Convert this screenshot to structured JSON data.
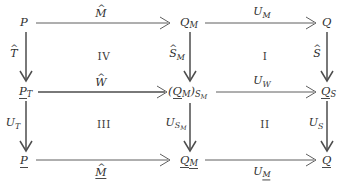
{
  "diagram": {
    "type": "commutative-diagram",
    "title": "",
    "grid": {
      "columns": 3,
      "rows": 3,
      "column_x": [
        24,
        188,
        326
      ],
      "row_y": [
        22,
        90,
        160
      ]
    },
    "nodes": [
      {
        "id": "n00",
        "row": 0,
        "col": 0,
        "text": "P",
        "base": "P",
        "hat": false,
        "underline": false,
        "sub": ""
      },
      {
        "id": "n01",
        "row": 0,
        "col": 1,
        "text": "Q_M",
        "base": "Q",
        "hat": false,
        "underline": false,
        "sub": "M"
      },
      {
        "id": "n02",
        "row": 0,
        "col": 2,
        "text": "Q",
        "base": "Q",
        "hat": false,
        "underline": false,
        "sub": ""
      },
      {
        "id": "n10",
        "row": 1,
        "col": 0,
        "text": "P_T",
        "base": "P",
        "hat": false,
        "underline": true,
        "sub": "T"
      },
      {
        "id": "n11",
        "row": 1,
        "col": 1,
        "text": "(Q_M)_S_M",
        "base": "(Q)",
        "hat": false,
        "underline": true,
        "sub": "S_M"
      },
      {
        "id": "n12",
        "row": 1,
        "col": 2,
        "text": "Q_S",
        "base": "Q",
        "hat": false,
        "underline": true,
        "sub": "S"
      },
      {
        "id": "n20",
        "row": 2,
        "col": 0,
        "text": "P",
        "base": "P",
        "hat": false,
        "underline": true,
        "sub": ""
      },
      {
        "id": "n21",
        "row": 2,
        "col": 1,
        "text": "Q_M",
        "base": "Q",
        "hat": false,
        "underline": true,
        "sub": "M"
      },
      {
        "id": "n22",
        "row": 2,
        "col": 2,
        "text": "Q",
        "base": "Q",
        "hat": false,
        "underline": true,
        "sub": ""
      }
    ],
    "edge_labels": {
      "top_left": {
        "base": "M",
        "hat": true,
        "underline": false,
        "sub": ""
      },
      "top_right": {
        "base": "U",
        "hat": false,
        "underline": false,
        "sub": "M"
      },
      "middle_left": {
        "base": "W",
        "hat": true,
        "underline": false,
        "sub": ""
      },
      "middle_right": {
        "base": "U",
        "hat": false,
        "underline": false,
        "sub": "W"
      },
      "bottom_left": {
        "base": "M",
        "hat": true,
        "underline": true,
        "sub": ""
      },
      "bottom_right": {
        "base": "U",
        "hat": false,
        "underline": false,
        "sub": "M-underlined"
      },
      "left_upper": {
        "base": "T",
        "hat": true,
        "underline": false,
        "sub": ""
      },
      "left_lower": {
        "base": "U",
        "hat": false,
        "underline": false,
        "sub": "T"
      },
      "center_upper": {
        "base": "S",
        "hat": true,
        "underline": false,
        "sub": "M"
      },
      "center_lower": {
        "base": "U",
        "hat": false,
        "underline": false,
        "sub": "S_M"
      },
      "right_upper": {
        "base": "S",
        "hat": true,
        "underline": false,
        "sub": ""
      },
      "right_lower": {
        "base": "U",
        "hat": false,
        "underline": false,
        "sub": "S"
      }
    },
    "region_labels": [
      {
        "id": "region-I",
        "text": "I",
        "row": 0,
        "col": 1
      },
      {
        "id": "region-II",
        "text": "II",
        "row": 1,
        "col": 1
      },
      {
        "id": "region-III",
        "text": "III",
        "row": 1,
        "col": 0
      },
      {
        "id": "region-IV",
        "text": "IV",
        "row": 0,
        "col": 0
      }
    ],
    "colors": {
      "stroke": "#4d4d4d",
      "text": "#2f2f2f",
      "background": "#ffffff"
    }
  }
}
